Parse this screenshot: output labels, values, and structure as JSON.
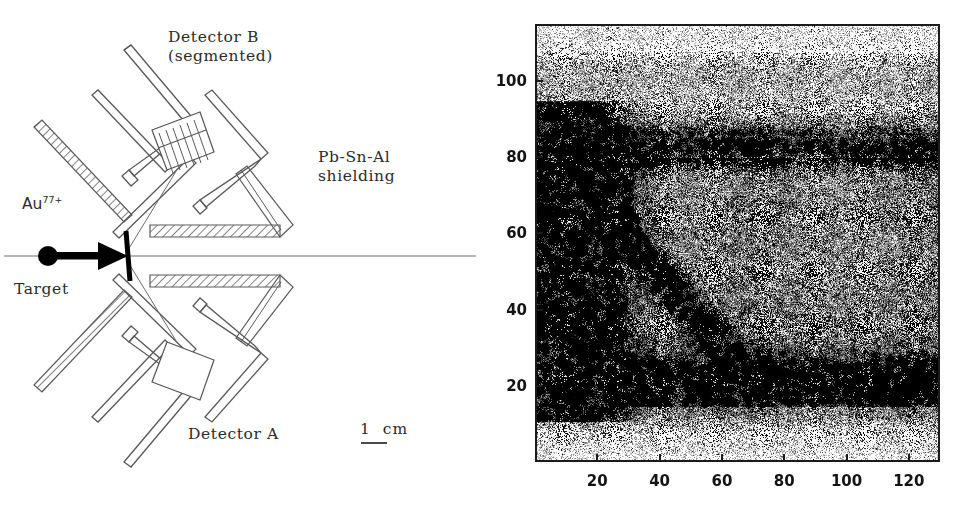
{
  "figure": {
    "background_color": "#ffffff",
    "panels": [
      "detector-setup-schematic",
      "coincidence-density-plot"
    ]
  },
  "schematic": {
    "labels": {
      "detector_b": "Detector B\n(segmented)",
      "shielding": "Pb-Sn-Al\nshielding",
      "beam_species": "Au",
      "beam_charge": "77+",
      "target": "Target",
      "detector_a": "Detector A"
    },
    "scale_bar": {
      "text": "1  cm",
      "length_label": "1 cm"
    },
    "elements": {
      "beam_axis": "horizontal-beam-line",
      "beam_particle": "filled-circle",
      "beam_arrow": "rightward-arrow",
      "target_foil": "tilted-vertical-line",
      "detector_b_crystal": "segmented-rectangle",
      "detector_b_segments": 7,
      "detector_a_crystal": "plain-rectangle",
      "shielding_style": "hatched-bars"
    },
    "colors": {
      "line": "#4a4a4a",
      "ink": "#2b2b2b",
      "beam_solid": "#000000"
    }
  },
  "chart_data": {
    "type": "heatmap",
    "title": "",
    "xlabel": "",
    "ylabel": "",
    "xlim": [
      0,
      130
    ],
    "ylim": [
      0,
      115
    ],
    "grid": false,
    "legend": "none",
    "xticks": [
      20,
      40,
      60,
      80,
      100,
      120
    ],
    "yticks": [
      20,
      40,
      60,
      80,
      100
    ],
    "xtick_labels": [
      "20",
      "40",
      "60",
      "80",
      "100",
      "120"
    ],
    "ytick_labels": [
      "20",
      "40",
      "60",
      "80",
      "100"
    ],
    "rendering": "monochrome-dot-density-scatter",
    "features": [
      {
        "name": "upper-horizontal-band",
        "kind": "horizontal-band",
        "y_center": 83,
        "y_halfwidth": 4.5,
        "x_range": [
          0,
          130
        ],
        "intensity": 0.95
      },
      {
        "name": "lower-horizontal-band",
        "kind": "horizontal-band",
        "y_center": 19,
        "y_halfwidth": 6.5,
        "x_range": [
          0,
          130
        ],
        "intensity": 0.9
      },
      {
        "name": "low-x-vertical-enhancement",
        "kind": "vertical-band",
        "x_center": 10,
        "x_halfwidth": 12,
        "y_range": [
          10,
          95
        ],
        "intensity": 0.7
      },
      {
        "name": "hotspot",
        "kind": "blob",
        "x_center": 15,
        "y_center": 78,
        "x_sigma": 9,
        "y_sigma": 4,
        "intensity": 1.0
      },
      {
        "name": "diagonal-ridge",
        "kind": "diagonal-ridge",
        "from": [
          12,
          76
        ],
        "to": [
          72,
          18
        ],
        "halfwidth": 4,
        "intensity": 0.75
      },
      {
        "name": "mid-continuum",
        "kind": "region",
        "x_range": [
          0,
          130
        ],
        "y_range": [
          14,
          80
        ],
        "intensity": 0.52
      },
      {
        "name": "upper-background",
        "kind": "region",
        "x_range": [
          0,
          130
        ],
        "y_range": [
          86,
          108
        ],
        "intensity": 0.34
      },
      {
        "name": "top-sparse-edge",
        "kind": "region",
        "x_range": [
          0,
          130
        ],
        "y_range": [
          108,
          115
        ],
        "intensity": 0.13
      },
      {
        "name": "bottom-sparse-edge",
        "kind": "region",
        "x_range": [
          0,
          130
        ],
        "y_range": [
          0,
          13
        ],
        "intensity": 0.15
      }
    ],
    "colors": {
      "dot": "#000000",
      "frame": "#1a1a1a",
      "background": "#ffffff"
    }
  }
}
